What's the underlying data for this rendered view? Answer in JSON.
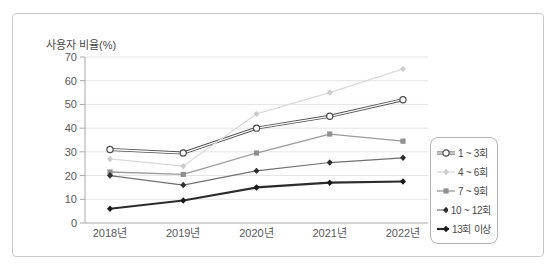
{
  "panel": {
    "background": "#ffffff",
    "border_color": "#c9c9c9"
  },
  "chart_data": {
    "type": "line",
    "title": "",
    "ylabel": "사용자 비율(%)",
    "xlabel": "",
    "ylim": [
      0,
      70
    ],
    "yticks": [
      0,
      10,
      20,
      30,
      40,
      50,
      60,
      70
    ],
    "grid": true,
    "legend_position": "right",
    "categories": [
      "2018년",
      "2019년",
      "2020년",
      "2021년",
      "2022년"
    ],
    "series": [
      {
        "name": "1 ~ 3회",
        "values": [
          31,
          29.5,
          40,
          45,
          52
        ],
        "color": "#4d4d4d",
        "marker": "open-circle",
        "width": 3,
        "double": true
      },
      {
        "name": "4 ~ 6회",
        "values": [
          27,
          24,
          46,
          55,
          65
        ],
        "color": "#d9d9d9",
        "marker": "diamond",
        "marker_color": "#cccccc",
        "width": 1.3
      },
      {
        "name": "7 ~ 9회",
        "values": [
          21.5,
          20.5,
          29.5,
          37.5,
          34.5
        ],
        "color": "#9b9b9b",
        "marker": "square",
        "marker_color": "#8f8f8f",
        "width": 1.3
      },
      {
        "name": "10 ~ 12회",
        "values": [
          20,
          16,
          22,
          25.5,
          27.5
        ],
        "color": "#707070",
        "marker": "diamond",
        "marker_color": "#2e2e2e",
        "width": 1.2
      },
      {
        "name": "13회 이상",
        "values": [
          6,
          9.5,
          15,
          17,
          17.5
        ],
        "color": "#2b2b2b",
        "marker": "diamond",
        "marker_color": "#1a1a1a",
        "width": 2.2
      }
    ],
    "colors": {
      "grid": "#e4e4e4",
      "axis": "#a8a8a8",
      "text": "#585858"
    }
  }
}
